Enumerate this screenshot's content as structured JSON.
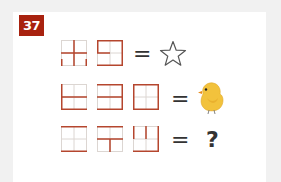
{
  "puzzle": {
    "number": "37",
    "badge_color": "#a8220f",
    "line_color_highlight": "#b5462e",
    "line_color_light": "#d9d4d0",
    "equals_sign": "=",
    "rows": [
      {
        "grids": [
          {
            "highlighted": [
              "mid-h",
              "mid-v",
              "left-bottom-stub",
              "right-bottom-stub"
            ]
          },
          {
            "highlighted": [
              "top",
              "mid-h-left",
              "right",
              "bottom",
              "left-top"
            ]
          }
        ],
        "result": {
          "type": "icon",
          "icon": "star-outline-icon",
          "glyph": "☆"
        }
      },
      {
        "grids": [
          {
            "highlighted": [
              "left",
              "mid-h",
              "bottom"
            ]
          },
          {
            "highlighted": [
              "top",
              "mid-h",
              "right",
              "bottom"
            ]
          },
          {
            "highlighted": [
              "top",
              "right",
              "bottom",
              "left"
            ]
          }
        ],
        "result": {
          "type": "icon",
          "icon": "chick-icon"
        }
      },
      {
        "grids": [
          {
            "highlighted": [
              "top",
              "bottom"
            ]
          },
          {
            "highlighted": [
              "top",
              "mid-h",
              "mid-v-bottom"
            ]
          },
          {
            "highlighted": [
              "left-top",
              "mid-v-top",
              "right",
              "bottom"
            ]
          }
        ],
        "result": {
          "type": "text",
          "text": "?"
        }
      }
    ]
  }
}
